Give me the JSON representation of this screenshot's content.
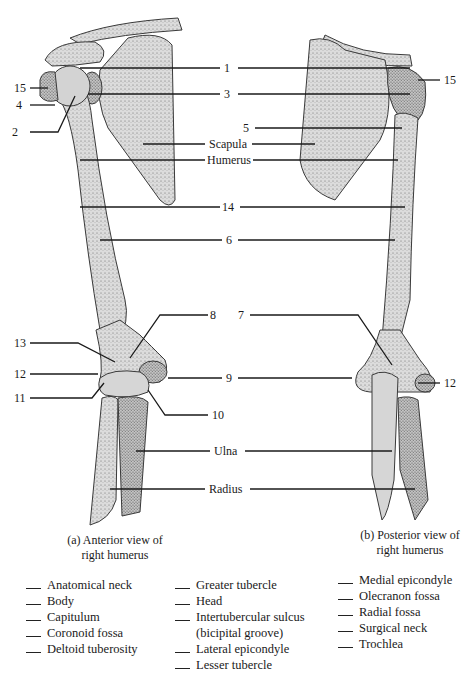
{
  "diagram": {
    "structure_labels": {
      "scapula": "Scapula",
      "humerus": "Humerus",
      "ulna": "Ulna",
      "radius": "Radius"
    },
    "number_labels": [
      {
        "id": "1",
        "text": "1"
      },
      {
        "id": "2",
        "text": "2"
      },
      {
        "id": "3",
        "text": "3"
      },
      {
        "id": "4",
        "text": "4"
      },
      {
        "id": "5",
        "text": "5"
      },
      {
        "id": "6",
        "text": "6"
      },
      {
        "id": "7",
        "text": "7"
      },
      {
        "id": "8",
        "text": "8"
      },
      {
        "id": "9",
        "text": "9"
      },
      {
        "id": "10",
        "text": "10"
      },
      {
        "id": "11",
        "text": "11"
      },
      {
        "id": "12a",
        "text": "12"
      },
      {
        "id": "12b",
        "text": "12"
      },
      {
        "id": "13",
        "text": "13"
      },
      {
        "id": "14",
        "text": "14"
      },
      {
        "id": "15a",
        "text": "15"
      },
      {
        "id": "15b",
        "text": "15"
      }
    ],
    "captions": {
      "anterior_line1": "(a) Anterior view of",
      "anterior_line2": "right humerus",
      "posterior_line1": "(b) Posterior view of",
      "posterior_line2": "right humerus"
    }
  },
  "word_bank": {
    "column1": [
      "Anatomical neck",
      "Body",
      "Capitulum",
      "Coronoid fossa",
      "Deltoid tuberosity"
    ],
    "column2": [
      "Greater tubercle",
      "Head",
      "Intertubercular sulcus",
      "(bicipital groove)",
      "Lateral epicondyle",
      "Lesser tubercle"
    ],
    "column3": [
      "Medial epicondyle",
      "Olecranon fossa",
      "Radial fossa",
      "Surgical neck",
      "Trochlea"
    ]
  },
  "colors": {
    "bone_fill": "#d9d9d9",
    "bone_stroke": "#3a3a3a",
    "leader_line": "#1a1a1a",
    "background": "#ffffff"
  }
}
